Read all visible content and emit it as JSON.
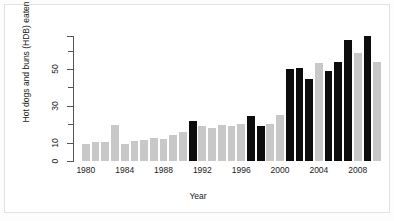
{
  "chart_data": {
    "type": "bar",
    "title": "",
    "subtitle": "",
    "xlabel": "Year",
    "ylabel": "Hot dogs and buns (HDB) eaten",
    "xlim": [
      1979.5,
      2010.5
    ],
    "ylim": [
      0,
      68
    ],
    "grid": false,
    "legend": "none",
    "xtick_labels": [
      "1980",
      "1984",
      "1988",
      "1992",
      "1996",
      "2000",
      "2004",
      "2008"
    ],
    "xtick_values": [
      1980,
      1984,
      1988,
      1992,
      1996,
      2000,
      2004,
      2008
    ],
    "ytick_labels": [
      "0",
      "10",
      "30",
      "50"
    ],
    "ytick_values": [
      0,
      10,
      30,
      50
    ],
    "yminor_values": [
      20,
      40,
      60
    ],
    "bar_colors": {
      "default": "#c8c8c8",
      "highlight": "#0d0d0d"
    },
    "categories": [
      1980,
      1981,
      1982,
      1983,
      1984,
      1985,
      1986,
      1987,
      1988,
      1989,
      1990,
      1991,
      1992,
      1993,
      1994,
      1995,
      1996,
      1997,
      1998,
      1999,
      2000,
      2001,
      2002,
      2003,
      2004,
      2005,
      2006,
      2007,
      2008,
      2009,
      2010
    ],
    "values": [
      9.1,
      10.2,
      10.5,
      19.5,
      9.5,
      11.0,
      11.5,
      12.5,
      12.0,
      14.0,
      16.0,
      21.5,
      19.0,
      18.0,
      19.5,
      19.0,
      20.0,
      24.5,
      19.0,
      20.0,
      25.0,
      50.0,
      50.5,
      44.5,
      53.5,
      49.0,
      54.0,
      66.0,
      59.0,
      68.0,
      54.0
    ],
    "highlighted": [
      1991,
      1997,
      1998,
      2001,
      2002,
      2003,
      2005,
      2006,
      2007,
      2009
    ],
    "series": [
      {
        "name": "Hot dogs and buns (HDB) eaten",
        "values": [
          9.1,
          10.2,
          10.5,
          19.5,
          9.5,
          11.0,
          11.5,
          12.5,
          12.0,
          14.0,
          16.0,
          21.5,
          19.0,
          18.0,
          19.5,
          19.0,
          20.0,
          24.5,
          19.0,
          20.0,
          25.0,
          50.0,
          50.5,
          44.5,
          53.5,
          49.0,
          54.0,
          66.0,
          59.0,
          68.0,
          54.0
        ]
      }
    ]
  }
}
